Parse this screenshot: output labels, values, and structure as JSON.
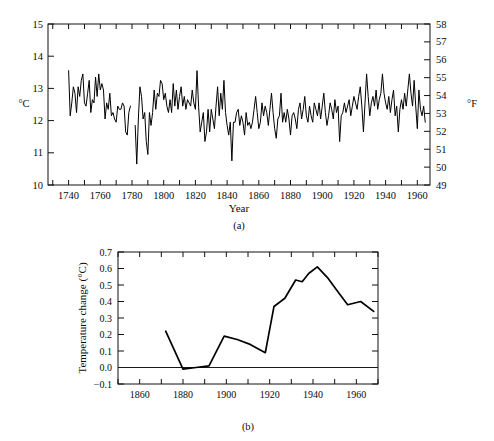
{
  "figure": {
    "panels": [
      {
        "caption": "(a)",
        "xlabel": "Year",
        "left_unit": "°C",
        "right_unit": "°F"
      },
      {
        "caption": "(b)",
        "ylabel": "Temperature change (°C)"
      }
    ]
  },
  "colors": {
    "line": "#000000",
    "axis": "#111111",
    "background": "#ffffff"
  },
  "chart_data": [
    {
      "type": "line",
      "title": "",
      "subtitle": "(a)",
      "xlabel": "Year",
      "ylabel": "°C",
      "y2label": "°F",
      "xlim": [
        1727,
        1968
      ],
      "ylim": [
        10,
        15
      ],
      "y2lim": [
        49,
        58
      ],
      "grid": false,
      "legend": "none",
      "xticks": [
        1740,
        1760,
        1780,
        1800,
        1820,
        1840,
        1860,
        1880,
        1900,
        1920,
        1940,
        1960
      ],
      "xticklabels": [
        "1740",
        "1760",
        "1780",
        "1800",
        "1820",
        "1840",
        "1860",
        "1880",
        "1900",
        "1920",
        "1940",
        "1960"
      ],
      "x_minor_tick_interval": 10,
      "yticks": [
        10,
        11,
        12,
        13,
        14,
        15
      ],
      "yticklabels": [
        "10",
        "11",
        "12",
        "13",
        "14",
        "15"
      ],
      "y2ticks": [
        49,
        50,
        51,
        52,
        53,
        54,
        55,
        56,
        57,
        58
      ],
      "y2ticklabels": [
        "49",
        "50",
        "51",
        "52",
        "53",
        "54",
        "55",
        "56",
        "57",
        "58"
      ],
      "series": [
        {
          "name": "Central England temperature",
          "x": [
            1740,
            1741,
            1742,
            1743,
            1744,
            1745,
            1746,
            1747,
            1748,
            1749,
            1750,
            1751,
            1752,
            1753,
            1754,
            1755,
            1756,
            1757,
            1758,
            1759,
            1760,
            1761,
            1762,
            1763,
            1764,
            1765,
            1766,
            1767,
            1768,
            1769,
            1770,
            1771,
            1772,
            1773,
            1774,
            1775,
            1776,
            1777,
            1778,
            1779,
            1782,
            1783,
            1784,
            1785,
            1786,
            1787,
            1788,
            1789,
            1790,
            1791,
            1792,
            1793,
            1794,
            1795,
            1796,
            1797,
            1798,
            1799,
            1800,
            1801,
            1802,
            1803,
            1804,
            1805,
            1806,
            1807,
            1808,
            1809,
            1810,
            1811,
            1812,
            1813,
            1814,
            1815,
            1816,
            1817,
            1818,
            1819,
            1820,
            1821,
            1822,
            1823,
            1824,
            1825,
            1826,
            1827,
            1828,
            1829,
            1830,
            1831,
            1832,
            1833,
            1834,
            1835,
            1836,
            1837,
            1838,
            1839,
            1840,
            1841,
            1842,
            1843,
            1844,
            1845,
            1846,
            1847,
            1848,
            1849,
            1850,
            1851,
            1852,
            1853,
            1854,
            1855,
            1856,
            1857,
            1858,
            1859,
            1860,
            1861,
            1862,
            1863,
            1864,
            1865,
            1866,
            1867,
            1868,
            1869,
            1870,
            1871,
            1872,
            1873,
            1874,
            1875,
            1876,
            1877,
            1878,
            1879,
            1880,
            1881,
            1882,
            1883,
            1884,
            1885,
            1886,
            1887,
            1888,
            1889,
            1890,
            1891,
            1892,
            1893,
            1894,
            1895,
            1896,
            1897,
            1898,
            1899,
            1900,
            1901,
            1902,
            1903,
            1904,
            1905,
            1906,
            1907,
            1908,
            1909,
            1910,
            1911,
            1912,
            1913,
            1914,
            1915,
            1916,
            1917,
            1918,
            1919,
            1920,
            1921,
            1922,
            1923,
            1924,
            1925,
            1926,
            1927,
            1928,
            1929,
            1930,
            1931,
            1932,
            1933,
            1934,
            1935,
            1936,
            1937,
            1938,
            1939,
            1940,
            1941,
            1942,
            1943,
            1944,
            1945,
            1946,
            1947,
            1948,
            1949,
            1950,
            1951,
            1952,
            1953,
            1954,
            1955,
            1956,
            1957,
            1958,
            1959,
            1960,
            1961,
            1962,
            1963,
            1964,
            1965
          ],
          "values": [
            13.55,
            12.15,
            12.55,
            13.05,
            12.85,
            12.25,
            13.05,
            12.75,
            13.25,
            13.45,
            12.55,
            12.45,
            12.85,
            13.25,
            12.25,
            12.65,
            12.55,
            13.35,
            12.75,
            13.45,
            12.95,
            13.15,
            12.95,
            12.05,
            12.55,
            12.35,
            12.85,
            12.15,
            12.25,
            12.05,
            11.95,
            12.45,
            12.35,
            12.35,
            12.55,
            12.45,
            11.65,
            11.55,
            12.25,
            12.45,
            11.85,
            10.65,
            12.05,
            13.05,
            12.75,
            12.05,
            12.25,
            11.35,
            10.95,
            12.25,
            11.85,
            12.25,
            12.95,
            12.35,
            12.85,
            12.75,
            13.25,
            13.15,
            12.65,
            12.85,
            12.45,
            12.25,
            12.65,
            12.25,
            13.15,
            12.45,
            12.95,
            12.35,
            12.75,
            13.05,
            12.45,
            12.75,
            12.35,
            12.65,
            12.55,
            12.45,
            12.95,
            12.55,
            12.35,
            13.55,
            12.45,
            11.65,
            11.95,
            12.25,
            11.35,
            11.65,
            12.35,
            11.65,
            12.35,
            12.05,
            11.75,
            12.45,
            13.05,
            12.15,
            12.85,
            12.35,
            13.25,
            12.25,
            11.85,
            11.55,
            11.95,
            10.75,
            11.95,
            11.95,
            12.25,
            12.35,
            11.85,
            12.15,
            11.95,
            11.55,
            12.25,
            11.85,
            11.95,
            11.75,
            11.95,
            12.35,
            12.75,
            12.25,
            11.75,
            11.95,
            12.55,
            12.15,
            12.45,
            12.25,
            11.85,
            12.35,
            12.85,
            12.25,
            11.75,
            11.45,
            12.05,
            12.15,
            12.85,
            11.95,
            12.25,
            11.95,
            12.35,
            12.05,
            11.55,
            12.15,
            12.25,
            12.05,
            11.75,
            12.35,
            12.55,
            12.05,
            12.35,
            12.75,
            12.15,
            11.95,
            12.45,
            12.15,
            11.95,
            12.55,
            12.35,
            12.15,
            12.55,
            12.05,
            12.45,
            12.85,
            12.25,
            11.85,
            12.15,
            12.55,
            12.35,
            12.05,
            12.65,
            12.25,
            12.45,
            11.35,
            12.15,
            12.25,
            12.55,
            12.25,
            12.45,
            12.65,
            12.15,
            12.45,
            12.75,
            12.55,
            12.35,
            12.75,
            13.05,
            12.45,
            11.65,
            12.55,
            13.45,
            12.75,
            12.15,
            12.55,
            12.75,
            12.45,
            12.95,
            12.35,
            12.65,
            12.85,
            13.45,
            12.85,
            12.55,
            12.35,
            12.75,
            12.25,
            12.65,
            12.95,
            12.15,
            12.45,
            11.65,
            12.35,
            12.65,
            12.35,
            12.85,
            12.45,
            12.95,
            13.45,
            12.85,
            12.45,
            13.25,
            12.45,
            11.75,
            12.95,
            12.35,
            12.15,
            12.45,
            11.95,
            12.45,
            12.25
          ]
        }
      ]
    },
    {
      "type": "line",
      "title": "",
      "subtitle": "(b)",
      "xlabel": "",
      "ylabel": "Temperature change (°C)",
      "xlim": [
        1850,
        1970
      ],
      "ylim": [
        -0.1,
        0.7
      ],
      "grid": false,
      "legend": "none",
      "xticks": [
        1860,
        1880,
        1900,
        1920,
        1940,
        1960
      ],
      "xticklabels": [
        "1860",
        "1880",
        "1900",
        "1920",
        "1940",
        "1960"
      ],
      "x_minor_tick_interval": 10,
      "yticks": [
        -0.1,
        0.0,
        0.1,
        0.2,
        0.3,
        0.4,
        0.5,
        0.6,
        0.7
      ],
      "yticklabels": [
        "−0.1",
        "0.0",
        "0.1",
        "0.2",
        "0.3",
        "0.4",
        "0.5",
        "0.6",
        "0.7"
      ],
      "zero_line": 0.0,
      "series": [
        {
          "name": "Temperature change",
          "x": [
            1872,
            1880,
            1886,
            1892,
            1899,
            1905,
            1911,
            1918,
            1922,
            1927,
            1932,
            1935,
            1938,
            1942,
            1947,
            1952,
            1956,
            1962,
            1968
          ],
          "values": [
            0.22,
            -0.01,
            0.0,
            0.01,
            0.19,
            0.17,
            0.14,
            0.09,
            0.37,
            0.42,
            0.53,
            0.52,
            0.57,
            0.61,
            0.54,
            0.45,
            0.38,
            0.4,
            0.34
          ]
        }
      ]
    }
  ]
}
